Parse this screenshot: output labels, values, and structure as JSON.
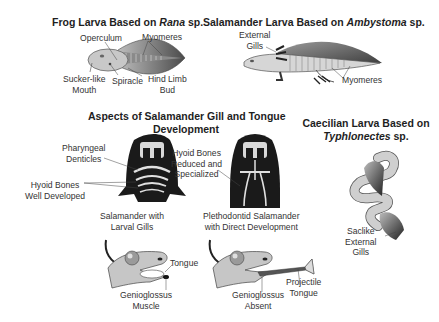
{
  "panels": {
    "frog": {
      "title_pre": "Frog Larva Based on ",
      "title_genus": "Rana",
      "title_post": " sp.",
      "labels": {
        "operculum": "Operculum",
        "myomeres": "Myomeres",
        "sucker_mouth_1": "Sucker-like",
        "sucker_mouth_2": "Mouth",
        "spiracle": "Spiracle",
        "hind_limb_1": "Hind Limb",
        "hind_limb_2": "Bud"
      }
    },
    "salamander": {
      "title_pre": "Salamander Larva Based on ",
      "title_genus": "Ambystoma",
      "title_post": " sp.",
      "labels": {
        "external_gills_1": "External",
        "external_gills_2": "Gills",
        "myomeres": "Myomeres"
      }
    },
    "gill_tongue": {
      "title_line1": "Aspects of Salamander Gill and Tongue",
      "title_line2": "Development",
      "labels": {
        "pharyngeal_1": "Pharyngeal",
        "pharyngeal_2": "Denticles",
        "hyoid_well_1": "Hyoid Bones",
        "hyoid_well_2": "Well Developed",
        "hyoid_reduced_1": "Hyoid Bones",
        "hyoid_reduced_2": "Reduced and",
        "hyoid_reduced_3": "Specialized",
        "larval_gills_1": "Salamander with",
        "larval_gills_2": "Larval Gills",
        "pletho_1": "Plethodontid Salamander",
        "pletho_2": "with Direct Development",
        "tongue": "Tongue",
        "genio_muscle_1": "Genioglossus",
        "genio_muscle_2": "Muscle",
        "genio_absent_1": "Genioglossus",
        "genio_absent_2": "Absent",
        "projectile_1": "Projectile",
        "projectile_2": "Tongue"
      }
    },
    "caecilian": {
      "title_line1": "Caecilian Larva Based on",
      "title_genus": "Typhlonectes",
      "title_post": " sp.",
      "labels": {
        "saclike_1": "Saclike",
        "saclike_2": "External",
        "saclike_3": "Gills"
      }
    }
  },
  "colors": {
    "body_fill": "#c8c8c8",
    "dark": "#1a1a1a",
    "outline": "#555555",
    "text": "#333333"
  }
}
